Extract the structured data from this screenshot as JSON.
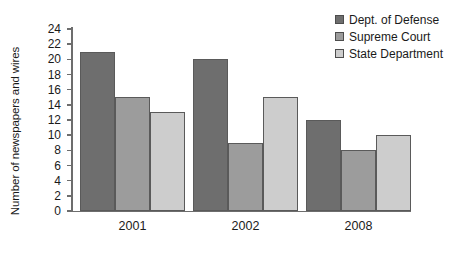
{
  "chart_data": {
    "type": "bar",
    "title": "",
    "xlabel": "",
    "ylabel": "Number of newspapers and wires",
    "categories": [
      "2001",
      "2002",
      "2008"
    ],
    "series": [
      {
        "name": "Dept. of Defense",
        "color": "#6e6e6e",
        "values": [
          21,
          20,
          12
        ]
      },
      {
        "name": "Supreme Court",
        "color": "#9c9c9c",
        "values": [
          15,
          9,
          8
        ]
      },
      {
        "name": "State Department",
        "color": "#cdcdcd",
        "values": [
          13,
          15,
          10
        ]
      }
    ],
    "ylim": [
      0,
      24
    ],
    "ytick_step": 2,
    "yticks": [
      0,
      2,
      4,
      6,
      8,
      10,
      12,
      14,
      16,
      18,
      20,
      22,
      24
    ],
    "ytick_labels": [
      "0",
      "2",
      "4",
      "6",
      "8",
      "10",
      "12",
      "14",
      "16",
      "18",
      "20",
      "22",
      "24"
    ],
    "grid": false,
    "legend_position": "top-right",
    "axis_color": "#6d6d6d",
    "bar_border_color": "#5a5a5a",
    "background": "#ffffff"
  }
}
